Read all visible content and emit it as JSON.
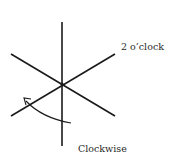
{
  "diagram": {
    "labels": {
      "two_oclock": "2 o’clock",
      "clockwise": "Clockwise"
    },
    "colors": {
      "line": "#1a1a1a",
      "text": "#2a2a2a",
      "background": "#ffffff"
    },
    "elements": [
      "vertical-axis-line",
      "diagonal-line-2-to-8-oclock",
      "diagonal-line-10-to-4-oclock",
      "clockwise-arc-arrow"
    ]
  }
}
